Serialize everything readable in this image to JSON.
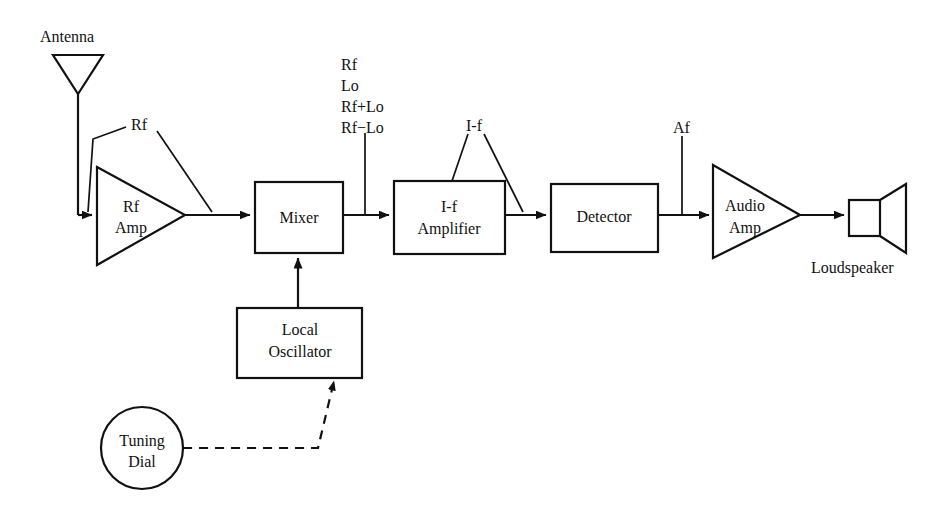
{
  "diagram": {
    "background_color": "#ffffff",
    "ink_color": "#111111"
  },
  "blocks": {
    "antenna": {
      "label": "Antenna",
      "shape": "antenna-triangle"
    },
    "rf_amp": {
      "label_line1": "Rf",
      "label_line2": "Amp",
      "shape": "triangle-amplifier"
    },
    "mixer": {
      "label": "Mixer",
      "shape": "rectangle"
    },
    "if_amplifier": {
      "label_line1": "I-f",
      "label_line2": "Amplifier",
      "shape": "rectangle"
    },
    "detector": {
      "label": "Detector",
      "shape": "rectangle"
    },
    "audio_amp": {
      "label_line1": "Audio",
      "label_line2": "Amp",
      "shape": "triangle-amplifier"
    },
    "loudspeaker": {
      "label": "Loudspeaker",
      "shape": "speaker-horn"
    },
    "local_oscillator": {
      "label_line1": "Local",
      "label_line2": "Oscillator",
      "shape": "rectangle"
    },
    "tuning_dial": {
      "label_line1": "Tuning",
      "label_line2": "Dial",
      "shape": "circle"
    }
  },
  "signal_labels": {
    "rf_at_amp": "Rf",
    "mixer_output": [
      "Rf",
      "Lo",
      "Rf+Lo",
      "Rf−Lo"
    ],
    "if_signal": "I-f",
    "af_signal": "Af"
  },
  "connections": [
    {
      "from": "antenna",
      "to": "rf_amp",
      "style": "solid-arrow"
    },
    {
      "from": "rf_amp",
      "to": "mixer",
      "style": "solid-arrow"
    },
    {
      "from": "mixer",
      "to": "if_amplifier",
      "style": "solid-arrow"
    },
    {
      "from": "if_amplifier",
      "to": "detector",
      "style": "solid-arrow"
    },
    {
      "from": "detector",
      "to": "audio_amp",
      "style": "solid-arrow"
    },
    {
      "from": "audio_amp",
      "to": "loudspeaker",
      "style": "solid-arrow"
    },
    {
      "from": "local_oscillator",
      "to": "mixer",
      "style": "solid-arrow"
    },
    {
      "from": "tuning_dial",
      "to": "local_oscillator",
      "style": "dashed-arrow"
    }
  ]
}
